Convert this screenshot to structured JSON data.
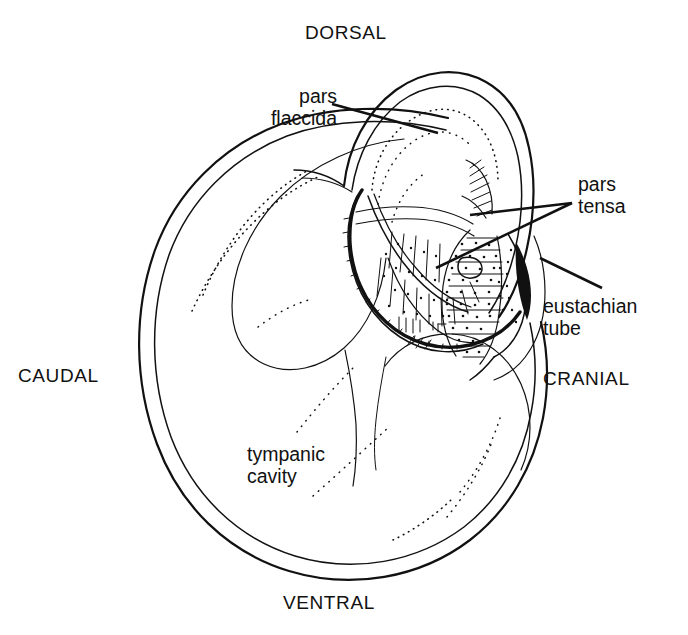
{
  "figure": {
    "background_color": "#ffffff",
    "ink_color": "#111111",
    "width": 688,
    "height": 635
  },
  "orientation_labels": {
    "dorsal": "DORSAL",
    "ventral": "VENTRAL",
    "caudal": "CAUDAL",
    "cranial": "CRANIAL"
  },
  "part_labels": {
    "pars_flaccida": "pars\nflaccida",
    "pars_tensa": "pars\ntensa",
    "eustachian_tube": "eustachian\ntube",
    "tympanic_cavity": "tympanic\ncavity"
  }
}
